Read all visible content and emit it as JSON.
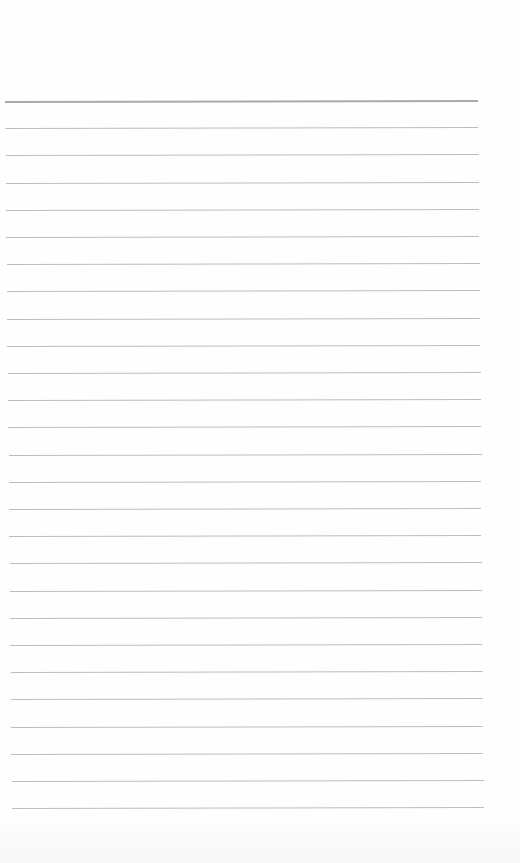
{
  "page": {
    "type": "lined-paper",
    "background": "#fefefe",
    "rule_color": "#bdbdbd",
    "header_rule_color": "#a9a9a9",
    "rule_count": 27,
    "first_rule_y": 101,
    "rule_spacing": 27.2,
    "rule_left_start": 5,
    "rule_right_start": 478,
    "rule_left_end": 12,
    "rule_right_end": 484
  }
}
